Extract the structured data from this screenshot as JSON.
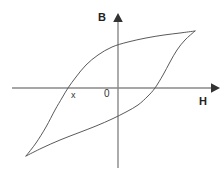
{
  "figure": {
    "kind": "hysteresis-loop-diagram",
    "background_color": "#ffffff"
  },
  "labels": {
    "y_axis": "B",
    "x_axis": "H",
    "origin": "0",
    "coercivity_point": "x"
  },
  "chart_data": {
    "type": "line",
    "title": "",
    "xlabel": "H",
    "ylabel": "B",
    "grid": false,
    "legend": null,
    "axes": {
      "x_axis_label": "H",
      "y_axis_label": "B",
      "origin_label": "0",
      "x_axis_arrow": "right",
      "y_axis_arrow": "up",
      "x_axis_pixel_y": 88,
      "y_axis_pixel_x": 118,
      "x_axis_pixel_range": [
        12,
        218
      ],
      "y_axis_pixel_range": [
        14,
        168
      ],
      "xlim": [
        -1.3,
        1.3
      ],
      "ylim": [
        -1.3,
        1.3
      ],
      "tick_labels_x": [],
      "tick_labels_y": []
    },
    "annotations": [
      {
        "text": "x",
        "meaning": "negative coercivity point where the upper branch crosses the H axis",
        "pixel_x": 73,
        "pixel_y": 95,
        "data_x": -0.58,
        "data_y": 0.0
      },
      {
        "text": "0",
        "meaning": "origin label",
        "pixel_x": 108,
        "pixel_y": 94,
        "data_x": 0.0,
        "data_y": 0.0
      }
    ],
    "series": [
      {
        "name": "upper-branch",
        "description": "descending (upper) branch of the B-H hysteresis loop, traced from the lower-left saturation tip to the upper-right saturation tip, passing above the origin",
        "points_pixel": [
          [
            26,
            156
          ],
          [
            36,
            143
          ],
          [
            46,
            127
          ],
          [
            55,
            110
          ],
          [
            62,
            98
          ],
          [
            68,
            88
          ],
          [
            76,
            77
          ],
          [
            86,
            65
          ],
          [
            98,
            55
          ],
          [
            112,
            47
          ],
          [
            128,
            42
          ],
          [
            146,
            38
          ],
          [
            164,
            35
          ],
          [
            180,
            33
          ],
          [
            195,
            31
          ]
        ],
        "points_data": [
          [
            -1.12,
            -0.87
          ],
          [
            -1.0,
            -0.73
          ],
          [
            -0.88,
            -0.52
          ],
          [
            -0.77,
            -0.29
          ],
          [
            -0.68,
            -0.13
          ],
          [
            -0.6,
            0.0
          ],
          [
            -0.51,
            0.15
          ],
          [
            -0.39,
            0.31
          ],
          [
            -0.24,
            0.44
          ],
          [
            -0.07,
            0.55
          ],
          [
            0.12,
            0.62
          ],
          [
            0.34,
            0.67
          ],
          [
            0.56,
            0.71
          ],
          [
            0.75,
            0.74
          ],
          [
            0.93,
            0.77
          ]
        ]
      },
      {
        "name": "lower-branch",
        "description": "ascending (lower) branch of the B-H hysteresis loop, traced from the lower-left saturation tip to the upper-right saturation tip, passing below the origin",
        "points_pixel": [
          [
            26,
            156
          ],
          [
            42,
            148
          ],
          [
            60,
            140
          ],
          [
            78,
            133
          ],
          [
            96,
            126
          ],
          [
            112,
            119
          ],
          [
            126,
            112
          ],
          [
            138,
            105
          ],
          [
            148,
            96
          ],
          [
            155,
            88
          ],
          [
            163,
            75
          ],
          [
            170,
            62
          ],
          [
            177,
            50
          ],
          [
            185,
            40
          ],
          [
            195,
            31
          ]
        ],
        "points_data": [
          [
            -1.12,
            -0.87
          ],
          [
            -0.93,
            -0.76
          ],
          [
            -0.71,
            -0.66
          ],
          [
            -0.49,
            -0.56
          ],
          [
            -0.27,
            -0.47
          ],
          [
            -0.07,
            -0.38
          ],
          [
            0.1,
            -0.29
          ],
          [
            0.24,
            -0.2
          ],
          [
            0.36,
            -0.09
          ],
          [
            0.45,
            0.0
          ],
          [
            0.55,
            0.16
          ],
          [
            0.63,
            0.33
          ],
          [
            0.72,
            0.48
          ],
          [
            0.81,
            0.61
          ],
          [
            0.93,
            0.77
          ]
        ]
      }
    ],
    "colors": {
      "curve": "#5a5a5a",
      "axis": "#888888",
      "arrow": "#333333",
      "text": "#222222"
    }
  }
}
